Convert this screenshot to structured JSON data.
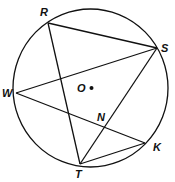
{
  "diagram": {
    "type": "geometry-circle-inscribed-chords",
    "stroke_color": "#111111",
    "background": "#ffffff",
    "circle": {
      "center_label": "O",
      "cx": 90,
      "cy": 88,
      "r": 78
    },
    "points": {
      "R": {
        "label": "R",
        "x": 48,
        "y": 23
      },
      "S": {
        "label": "S",
        "x": 157,
        "y": 48
      },
      "W": {
        "label": "W",
        "x": 16,
        "y": 93
      },
      "K": {
        "label": "K",
        "x": 145,
        "y": 143
      },
      "T": {
        "label": "T",
        "x": 80,
        "y": 164
      },
      "N": {
        "label": "N",
        "x": 105,
        "y": 127
      },
      "O": {
        "label": "O",
        "x": 91,
        "y": 88
      }
    },
    "segments": [
      [
        "R",
        "S"
      ],
      [
        "R",
        "T"
      ],
      [
        "W",
        "S"
      ],
      [
        "W",
        "K"
      ],
      [
        "S",
        "T"
      ],
      [
        "T",
        "K"
      ]
    ]
  }
}
